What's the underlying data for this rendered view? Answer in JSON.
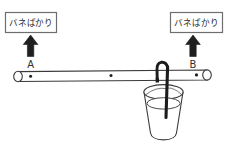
{
  "figure": {
    "type": "physics-diagram",
    "title_visible": false,
    "background_color": "#ffffff",
    "line_color": "#3a3a3a",
    "dark_wire_color": "#1c1c1c",
    "label_box_border_color": "#6e6e6e",
    "text_color": "#2a2a2a"
  },
  "scales": [
    {
      "id": "left",
      "label": "バネばかり",
      "arrow_direction": "up",
      "attach_point_label": "A"
    },
    {
      "id": "right",
      "label": "バネばかり",
      "arrow_direction": "up",
      "attach_point_label": "B"
    }
  ],
  "rod": {
    "name": "horizontal-rod",
    "markers": [
      {
        "id": "left-end",
        "label": "A"
      },
      {
        "id": "center",
        "label": ""
      },
      {
        "id": "right-end",
        "label": "B"
      }
    ],
    "marker_count": 3
  },
  "bucket": {
    "name": "water-bucket",
    "contains_water": true,
    "water_line_visible": true,
    "handle": "wire-hook-over-rod"
  }
}
